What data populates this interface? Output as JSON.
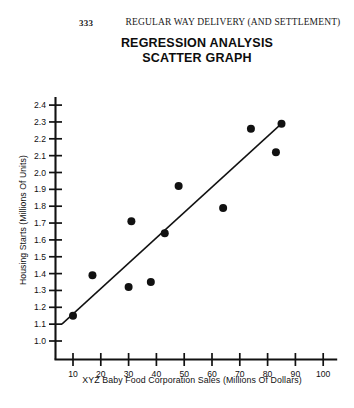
{
  "page": {
    "number": "333",
    "running_header": "REGULAR WAY DELIVERY (AND SETTLEMENT)"
  },
  "chart_data": {
    "type": "scatter",
    "title": "REGRESSION ANALYSIS",
    "subtitle": "SCATTER GRAPH",
    "xlabel": "XYZ Baby Food Corporation Sales (Millions Of Dollars)",
    "ylabel": "Housing Starts (Millions Of Units)",
    "xlim": [
      0,
      104
    ],
    "ylim": [
      0.95,
      2.45
    ],
    "xticks": [
      10,
      20,
      30,
      40,
      50,
      60,
      70,
      80,
      90,
      100
    ],
    "yticks": [
      "1.0",
      "1.1",
      "1.2",
      "1.3",
      "1.4",
      "1.5",
      "1.6",
      "1.7",
      "1.8",
      "1.9",
      "2.0",
      "2.1",
      "2.2",
      "2.3",
      "2.4"
    ],
    "ytick_values": [
      1.0,
      1.1,
      1.2,
      1.3,
      1.4,
      1.5,
      1.6,
      1.7,
      1.8,
      1.9,
      2.0,
      2.1,
      2.2,
      2.3,
      2.4
    ],
    "grid": false,
    "legend": "none",
    "marker_color": "#111111",
    "line_color": "#111111",
    "points": [
      {
        "x": 10,
        "y": 1.15
      },
      {
        "x": 17,
        "y": 1.39
      },
      {
        "x": 30,
        "y": 1.32
      },
      {
        "x": 31,
        "y": 1.71
      },
      {
        "x": 38,
        "y": 1.35
      },
      {
        "x": 43,
        "y": 1.64
      },
      {
        "x": 48,
        "y": 1.92
      },
      {
        "x": 64,
        "y": 1.79
      },
      {
        "x": 74,
        "y": 2.26
      },
      {
        "x": 83,
        "y": 2.12
      },
      {
        "x": 85,
        "y": 2.29
      }
    ],
    "regression_line": {
      "x0": 6,
      "y0": 1.1,
      "x1": 85,
      "y1": 2.29
    }
  }
}
